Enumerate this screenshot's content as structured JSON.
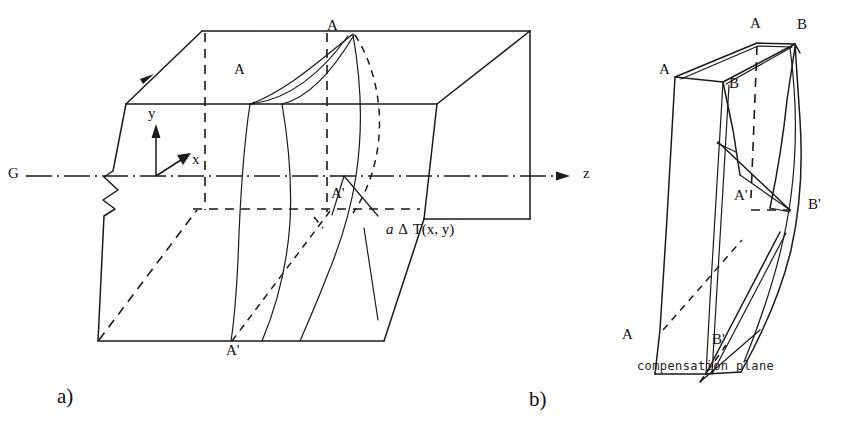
{
  "figure": {
    "caption_panels": [
      {
        "key": "a",
        "label": "a)"
      },
      {
        "key": "b",
        "label": "b)"
      }
    ]
  },
  "panel_a": {
    "name": "thermally-deformed-block",
    "axes": {
      "y_label": "y",
      "x_label": "x",
      "z_label": "z",
      "optical_axis_label": "G"
    },
    "wavefront_labels": {
      "top_front": "A",
      "top_rear": "A",
      "bottom_front": "A'"
    },
    "annotation": {
      "coefficient": "a",
      "delta": "Δ",
      "quantity": "T",
      "argument": "(x, y)",
      "full_text": "a Δ T (x, y)"
    }
  },
  "panel_b": {
    "name": "compensation-plane-block",
    "corner_labels": {
      "top_left": "A",
      "top_center": "A",
      "top_right": "B",
      "inner_upper": "B",
      "mid_left": "A'",
      "mid_right": "B'",
      "bottom_left": "A",
      "bottom_right": "B'"
    },
    "caption": "compensation plane"
  },
  "style": {
    "ink": "#1a1a1a",
    "paper": "#ffffff"
  }
}
